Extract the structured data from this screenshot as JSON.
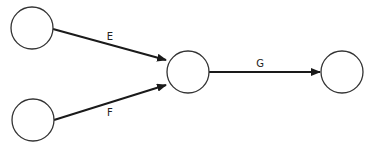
{
  "diagram": {
    "type": "activity-network",
    "nodes": [
      {
        "id": "n1",
        "cx": 32,
        "cy": 28,
        "r": 21
      },
      {
        "id": "n2",
        "cx": 33,
        "cy": 120,
        "r": 21
      },
      {
        "id": "n3",
        "cx": 188,
        "cy": 72,
        "r": 21
      },
      {
        "id": "n4",
        "cx": 342,
        "cy": 72,
        "r": 21
      }
    ],
    "edges": [
      {
        "id": "E",
        "label": "E",
        "from": "n1",
        "to": "n3",
        "x1": 53,
        "y1": 29,
        "x2": 166,
        "y2": 60,
        "lx": 110,
        "ly": 40
      },
      {
        "id": "F",
        "label": "F",
        "from": "n2",
        "to": "n3",
        "x1": 54,
        "y1": 120,
        "x2": 166,
        "y2": 85,
        "lx": 110,
        "ly": 116
      },
      {
        "id": "G",
        "label": "G",
        "from": "n3",
        "to": "n4",
        "x1": 209,
        "y1": 72,
        "x2": 320,
        "y2": 72,
        "lx": 260,
        "ly": 67
      }
    ],
    "colors": {
      "stroke": "#1a1a1a",
      "node_stroke": "#333333",
      "background": "#ffffff"
    }
  }
}
